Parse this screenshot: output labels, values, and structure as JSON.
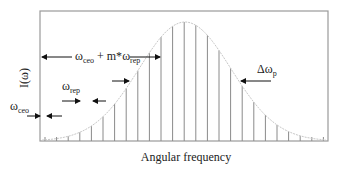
{
  "diagram": {
    "type": "frequency-comb",
    "y_axis_label": "I(ω)",
    "x_axis_label": "Angular frequency",
    "annotations": {
      "offset": {
        "base": "ω",
        "sub": "ceo"
      },
      "spacing": {
        "base": "ω",
        "sub": "rep"
      },
      "mode": {
        "base1": "ω",
        "sub1": "ceo",
        "mid": " + m*",
        "base2": "ω",
        "sub2": "rep"
      },
      "bandwidth": {
        "base": "Δω",
        "sub": "p"
      }
    },
    "colors": {
      "frame": "#9a9a9a",
      "comb_lines": "#8a8a8a",
      "envelope": "#c8c8c8",
      "arrows": "#111111",
      "text": "#222222"
    },
    "comb": {
      "first_line_x": 45,
      "spacing_px": 11.6,
      "count": 25,
      "peak_x": 185,
      "peak_y": 22,
      "baseline_y": 141,
      "sigma_px": 46
    }
  }
}
